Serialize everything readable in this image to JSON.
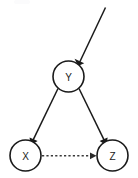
{
  "diagram": {
    "type": "directed-acyclic-graph",
    "background_color": "#ffffff",
    "stroke_color": "#1a1a1a",
    "dashed_stroke_color": "#3a3a3a",
    "nodes": [
      {
        "id": "Y",
        "label": "Y",
        "cx": 68.5,
        "cy": 76.5,
        "r": 15.5
      },
      {
        "id": "X",
        "label": "X",
        "cx": 25.5,
        "cy": 155.5,
        "r": 15.5
      },
      {
        "id": "Z",
        "label": "Z",
        "cx": 112.5,
        "cy": 155.5,
        "r": 15.5
      }
    ],
    "edges": [
      {
        "id": "external-to-Y",
        "from": "external",
        "to": "Y",
        "style": "solid",
        "arrow": "to",
        "description": "incoming arrow from upper right into Y"
      },
      {
        "id": "Y-to-X",
        "from": "Y",
        "to": "X",
        "style": "solid",
        "arrow": "to",
        "description": "Y causes X"
      },
      {
        "id": "Y-to-Z",
        "from": "Y",
        "to": "Z",
        "style": "solid",
        "arrow": "to",
        "description": "Y causes Z"
      },
      {
        "id": "X-to-Z",
        "from": "X",
        "to": "Z",
        "style": "dashed",
        "arrow": "to",
        "description": "dashed arrow from X to Z"
      }
    ]
  }
}
